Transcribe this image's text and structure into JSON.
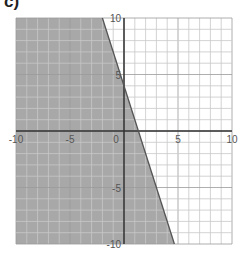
{
  "problem": {
    "label": "c)"
  },
  "chart_data": {
    "type": "area",
    "title": "",
    "xlabel": "",
    "ylabel": "",
    "xlim": [
      -10,
      10
    ],
    "ylim": [
      -10,
      10
    ],
    "grid": true,
    "grid_step": 1,
    "x_tick_labels": [
      "-10",
      "-5",
      "0",
      "5",
      "10"
    ],
    "y_tick_labels": [
      "10",
      "5",
      "-5",
      "-10"
    ],
    "boundary_line": {
      "equation": "y = -3x + 4",
      "slope": -3,
      "intercept": 4,
      "style": "solid",
      "points": [
        [
          -2,
          10
        ],
        [
          4.667,
          -10
        ]
      ]
    },
    "inequality": "y <= -3x + 4",
    "shaded_region": "left/below the line",
    "colors": {
      "shade": "#a8a8a8",
      "grid": "#c8c8c8",
      "axis": "#333333",
      "line": "#555555"
    }
  }
}
